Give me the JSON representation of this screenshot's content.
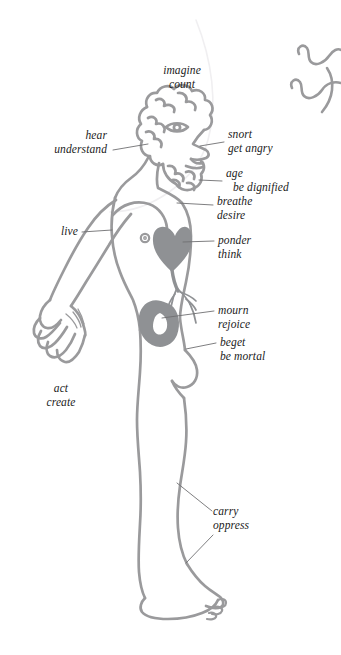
{
  "diagram": {
    "background_color": "#ffffff",
    "outline_color": "#9a9a9c",
    "organ_fill_color": "#8f9194",
    "leader_line_color": "#6f6f72",
    "text_color": "#1b1b1b",
    "labels": [
      {
        "id": "head-top",
        "line1": "imagine",
        "line2": "count",
        "align": "center"
      },
      {
        "id": "ear",
        "line1": "hear",
        "line2": "understand",
        "align": "right"
      },
      {
        "id": "nose",
        "line1": "snort",
        "line2": "get angry",
        "align": "left"
      },
      {
        "id": "beard",
        "line1": "age",
        "line2": "be dignified",
        "align": "left"
      },
      {
        "id": "throat",
        "line1": "breathe",
        "line2": "desire",
        "align": "left"
      },
      {
        "id": "arm",
        "line1": "live",
        "line2": "",
        "align": "right"
      },
      {
        "id": "heart",
        "line1": "ponder",
        "line2": "think",
        "align": "left"
      },
      {
        "id": "kidney",
        "line1": "mourn",
        "line2": "rejoice",
        "align": "left"
      },
      {
        "id": "loins",
        "line1": "beget",
        "line2": "be mortal",
        "align": "left"
      },
      {
        "id": "hand",
        "line1": "act",
        "line2": "create",
        "align": "center"
      },
      {
        "id": "leg-foot",
        "line1": "carry",
        "line2": "oppress",
        "align": "left"
      }
    ],
    "organs": [
      {
        "id": "heart",
        "name": "heart-shape"
      },
      {
        "id": "kidney",
        "name": "kidney-shape"
      }
    ],
    "decorations": [
      {
        "id": "squiggle-upper",
        "name": "wavy-line"
      },
      {
        "id": "squiggle-lower",
        "name": "wavy-line"
      },
      {
        "id": "ghost-arc",
        "name": "faint-arc"
      }
    ]
  }
}
